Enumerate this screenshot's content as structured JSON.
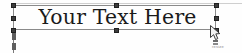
{
  "canvas": {
    "width": 242,
    "height": 53,
    "background_color": "#fefefe"
  },
  "guide": {
    "name": "page-guide-line",
    "color": "#cfcfcf"
  },
  "text_object": {
    "content": "Your Text Here",
    "text_color": "#1a1a1a",
    "frame_color": "#8a8a8a",
    "selected": true,
    "handle_color": "#3c3c3c",
    "handles": [
      {
        "position": "top-left"
      },
      {
        "position": "top-middle"
      },
      {
        "position": "top-right"
      },
      {
        "position": "middle-left"
      },
      {
        "position": "middle-right"
      },
      {
        "position": "bottom-left"
      },
      {
        "position": "bottom-middle"
      },
      {
        "position": "bottom-right"
      }
    ]
  },
  "ruler_markers": [
    {
      "label": "first-line-indent"
    },
    {
      "label": "left-indent"
    }
  ],
  "cursor": {
    "type": "resize-pointer",
    "caption": "resize"
  }
}
